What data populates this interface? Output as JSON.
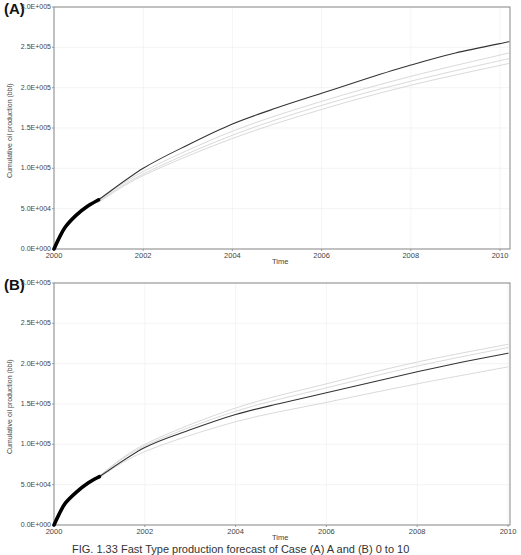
{
  "caption": "FIG. 1.33 Fast Type production forecast of Case (A) A and (B) 0 to 10",
  "chart_data": [
    {
      "type": "line",
      "panel_label": "(A)",
      "title": "",
      "xlabel": "Time",
      "ylabel": "Cumulative oil production (bbl)",
      "xlim": [
        2000,
        2010.2
      ],
      "ylim": [
        0,
        300000
      ],
      "grid": true,
      "x_ticks": [
        "2000",
        "2002",
        "2004",
        "2006",
        "2008",
        "2010"
      ],
      "y_ticks": [
        "0.0E+000",
        "5.0E+004",
        "1.0E+005",
        "1.5E+005",
        "2.0E+005",
        "2.5E+005",
        "3.0E+005"
      ],
      "series": [
        {
          "name": "History (observed)",
          "style": "thick-black",
          "x": [
            2000,
            2000.1,
            2000.25,
            2000.5,
            2000.75,
            2001
          ],
          "values": [
            0,
            12000,
            27000,
            42000,
            53000,
            61000
          ]
        },
        {
          "name": "Forecast (base)",
          "style": "dark-line",
          "x": [
            2001,
            2002,
            2003,
            2004,
            2005,
            2006,
            2007,
            2008,
            2009,
            2010.2
          ],
          "values": [
            61000,
            100000,
            129000,
            155000,
            175000,
            193000,
            211000,
            228000,
            243000,
            257000
          ]
        },
        {
          "name": "Ensemble member 1",
          "style": "light-gray",
          "x": [
            2001,
            2002,
            2004,
            2006,
            2008,
            2010.2
          ],
          "values": [
            60000,
            96000,
            146000,
            183000,
            214000,
            243000
          ]
        },
        {
          "name": "Ensemble member 2",
          "style": "light-gray",
          "x": [
            2001,
            2002,
            2004,
            2006,
            2008,
            2010.2
          ],
          "values": [
            59000,
            93000,
            141000,
            178000,
            208000,
            236000
          ]
        },
        {
          "name": "Ensemble member 3",
          "style": "light-gray",
          "x": [
            2001,
            2002,
            2004,
            2006,
            2008,
            2010.2
          ],
          "values": [
            58000,
            91000,
            137000,
            173000,
            203000,
            230000
          ]
        }
      ]
    },
    {
      "type": "line",
      "panel_label": "(B)",
      "title": "",
      "xlabel": "Time",
      "ylabel": "Cumulative oil production (bbl)",
      "xlim": [
        2000,
        2010
      ],
      "ylim": [
        0,
        300000
      ],
      "grid": true,
      "x_ticks": [
        "2000",
        "2002",
        "2004",
        "2006",
        "2008",
        "2010"
      ],
      "y_ticks": [
        "0.0E+000",
        "5.0E+004",
        "1.0E+005",
        "1.5E+005",
        "2.0E+005",
        "2.5E+005",
        "3.0E+005"
      ],
      "series": [
        {
          "name": "History (observed)",
          "style": "thick-black",
          "x": [
            2000,
            2000.1,
            2000.25,
            2000.5,
            2000.75,
            2001
          ],
          "values": [
            0,
            12000,
            27000,
            41000,
            52000,
            60000
          ]
        },
        {
          "name": "Forecast (base)",
          "style": "dark-line",
          "x": [
            2001,
            2002,
            2003,
            2004,
            2005,
            2006,
            2007,
            2008,
            2009,
            2010
          ],
          "values": [
            60000,
            96000,
            118000,
            137000,
            151000,
            164000,
            177000,
            190000,
            202000,
            213000
          ]
        },
        {
          "name": "Ensemble member 1",
          "style": "light-gray",
          "x": [
            2001,
            2002,
            2004,
            2006,
            2008,
            2010
          ],
          "values": [
            61000,
            100000,
            145000,
            175000,
            202000,
            224000
          ]
        },
        {
          "name": "Ensemble member 2",
          "style": "light-gray",
          "x": [
            2001,
            2002,
            2004,
            2006,
            2008,
            2010
          ],
          "values": [
            61000,
            98000,
            141000,
            170000,
            197000,
            220000
          ]
        },
        {
          "name": "Ensemble member 3",
          "style": "light-gray",
          "x": [
            2001,
            2002,
            2004,
            2006,
            2008,
            2010
          ],
          "values": [
            59000,
            91000,
            128000,
            152000,
            175000,
            196000
          ]
        }
      ]
    }
  ],
  "colors": {
    "axis": "#888888",
    "grid": "#ececec",
    "main_line": "#333333",
    "history": "#000000",
    "ensemble": "#cfcfcf"
  }
}
